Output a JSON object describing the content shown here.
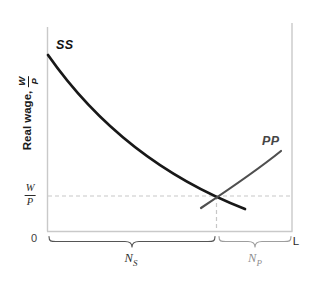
{
  "figure": {
    "y_axis_title": {
      "text": "Real wage,",
      "frac_num": "W",
      "frac_den": "P"
    },
    "curve_labels": {
      "ss": "SS",
      "pp": "PP"
    },
    "wage_level_label": {
      "num": "W",
      "den": "P"
    },
    "origin_label": "0",
    "x_end_label": "L",
    "segment_labels": {
      "ns_main": "N",
      "ns_sub": "S",
      "np_main": "N",
      "np_sub": "P"
    }
  },
  "colors": {
    "ss_curve": "#181818",
    "pp_curve": "#4f4f4f",
    "axis": "#c9c9c9",
    "dashed": "#c7c7c7",
    "ns_brace": "#555555",
    "np_brace": "#9e9e9e"
  },
  "chart_data": {
    "type": "line",
    "title": "",
    "xlabel": "",
    "ylabel": "Real wage, W/P",
    "x_axis": {
      "origin_label": "0",
      "end_label": "L",
      "numeric_ticks": "none (qualitative diagram)"
    },
    "y_axis": {
      "numeric_ticks": "none (qualitative diagram)"
    },
    "grid": "off",
    "legend": "none (curves labeled inline as SS and PP)",
    "series": [
      {
        "name": "SS",
        "description": "downward-sloping convex curve, black",
        "x": [
          0.004,
          0.147,
          0.327,
          0.543,
          0.69,
          0.808
        ],
        "y": [
          0.863,
          0.647,
          0.441,
          0.26,
          0.162,
          0.108
        ]
      },
      {
        "name": "PP",
        "description": "upward-sloping curve, dark gray",
        "x": [
          0.629,
          0.69,
          0.788,
          0.878,
          0.955
        ],
        "y": [
          0.113,
          0.162,
          0.245,
          0.328,
          0.392
        ]
      }
    ],
    "equilibrium": {
      "x": 0.69,
      "y": 0.17,
      "marked_by": "dashed horizontal line at wage W/P and dashed vertical line at intersection of SS and PP"
    },
    "annotations": [
      {
        "label": "W/P",
        "meaning": "real wage level on y-axis at dashed line"
      },
      {
        "label": "N_S",
        "meaning": "underbrace from 0 to equilibrium employment",
        "span_x": [
          0.0,
          0.69
        ]
      },
      {
        "label": "N_P",
        "meaning": "underbrace from equilibrium employment to L",
        "span_x": [
          0.69,
          1.0
        ]
      }
    ],
    "axis_ranges": {
      "x": [
        0,
        1
      ],
      "y": [
        0,
        1
      ]
    }
  },
  "svg_paths": {
    "left_axis": "M47.5 27 L47.5 231.5",
    "bottom_axis": "M47 231.5 L292.5 231.5",
    "right_axis": "M292 23 L292 231.5",
    "dashed_wage": "M48 196 L291.5 196",
    "dashed_employment": "M216.5 196 L216.5 231",
    "ss": "M48 55 C90 115 150 172 245 209",
    "pp": "M201 208 C225 192 255 172 281 151",
    "brace_ns": "M49 236.5 C49 241.5 51 241.5 56 241.5 L125 241.5 C129.5 241.5 132 242.5 132 247 C132 242.5 134.5 241.5 139 241.5 L208 241.5 C213 241.5 215 241.5 215 236.5",
    "brace_np": "M219 236.5 C219 241.5 221 241.5 226 241.5 L248 241.5 C252.5 241.5 255 242.5 255 247 C255 242.5 257.5 241.5 262 241.5 L284 241.5 C289 241.5 291 241.5 291 236.5"
  }
}
